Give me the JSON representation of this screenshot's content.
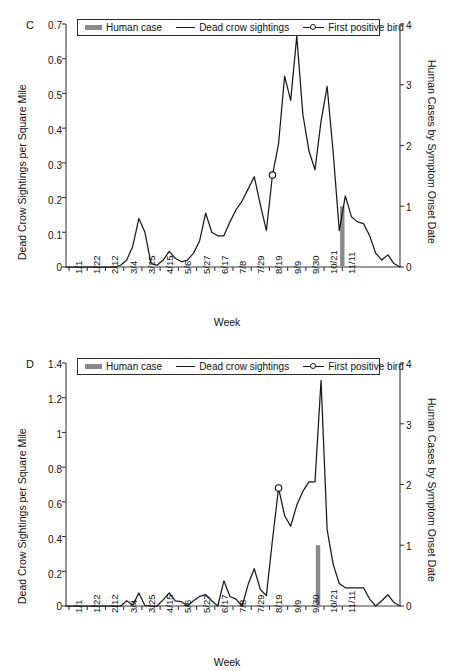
{
  "figure": {
    "xlabel": "Week",
    "ylabel_left": "Dead Crow Sightings per Square Mile",
    "ylabel_right": "Human Cases by Symptom Onset Date",
    "legend": {
      "human_case": "Human case",
      "dead_crow": "Dead crow sightings",
      "first_bird": "First positive bird"
    },
    "colors": {
      "line": "#1a1a1a",
      "human_case_bar": "#8a8a8a",
      "axis": "#3a3a3a",
      "background": "#ffffff"
    },
    "xticklabels": [
      "1/1",
      "1/22",
      "2/12",
      "3/4",
      "3/25",
      "4/15",
      "5/6",
      "5/27",
      "6/17",
      "7/8",
      "7/29",
      "8/19",
      "9/9",
      "9/30",
      "10/21",
      "11/11"
    ]
  },
  "chart_data": [
    {
      "type": "line",
      "panel": "C",
      "title": "",
      "xlabel": "Week",
      "ylabel": "Dead Crow Sightings per Square Mile",
      "ylabel_secondary": "Human Cases by Symptom Onset Date",
      "ylim": [
        0,
        0.7
      ],
      "yticks": [
        0,
        0.1,
        0.2,
        0.3,
        0.4,
        0.5,
        0.6,
        0.7
      ],
      "yticklabels": [
        "0",
        "0.1",
        "0.2",
        "0.3",
        "0.4",
        "0.5",
        "0.6",
        "0.7"
      ],
      "ylim_secondary": [
        0,
        4
      ],
      "yticks_secondary": [
        0,
        1,
        2,
        3,
        4
      ],
      "yticklabels_secondary": [
        "0",
        "1",
        "2",
        "3",
        "4"
      ],
      "xlim": [
        0,
        45
      ],
      "xticks": [
        0,
        3,
        6,
        9,
        12,
        15,
        18,
        21,
        24,
        27,
        30,
        33,
        36,
        39,
        42,
        45
      ],
      "xticklabels": [
        "1/1",
        "1/22",
        "2/12",
        "3/4",
        "3/25",
        "4/15",
        "5/6",
        "5/27",
        "6/17",
        "7/8",
        "7/29",
        "8/19",
        "9/9",
        "9/30",
        "10/21",
        "11/11"
      ],
      "grid": false,
      "legend_position": "top-center",
      "series": [
        {
          "name": "Dead crow sightings",
          "x": [
            0,
            1,
            2,
            3,
            4,
            5,
            6,
            7,
            8,
            9,
            10,
            11,
            12,
            13,
            14,
            15,
            16,
            17,
            18,
            19,
            20,
            21,
            22,
            23,
            24,
            25,
            26,
            27,
            28,
            29,
            30,
            31,
            32,
            33,
            34,
            35,
            36,
            37,
            38,
            39,
            40,
            41,
            42,
            43,
            44,
            45
          ],
          "values": [
            0,
            0,
            0,
            0,
            0,
            0,
            0,
            0,
            0,
            0.005,
            0.02,
            0.06,
            0.14,
            0.1,
            0.01,
            0.005,
            0.02,
            0.045,
            0.025,
            0.015,
            0.02,
            0.04,
            0.075,
            0.155,
            0.1,
            0.09,
            0.09,
            0.13,
            0.165,
            0.19,
            0.225,
            0.26,
            0.18,
            0.105,
            0.265,
            0.355,
            0.55,
            0.48,
            0.665,
            0.44,
            0.335,
            0.28,
            0.42,
            0.52,
            0.33,
            0.105
          ]
        }
      ],
      "markers": [
        {
          "name": "First positive bird",
          "x": 34,
          "y": 0.265,
          "label": "First positive bird"
        }
      ],
      "bars": [
        {
          "name": "Human case",
          "x": 45.5,
          "value_secondary": 1,
          "value_left_equiv": 0.175
        }
      ],
      "tail": {
        "note": "after last plotted point curve declines toward 0 by 11/11",
        "x": [
          46,
          47,
          48,
          49,
          50,
          51,
          52,
          53,
          54,
          55
        ],
        "values": [
          0.205,
          0.145,
          0.13,
          0.125,
          0.09,
          0.04,
          0.02,
          0.035,
          0.01,
          0
        ]
      }
    },
    {
      "type": "line",
      "panel": "D",
      "title": "",
      "xlabel": "Week",
      "ylabel": "Dead Crow Sightings per Square Mile",
      "ylabel_secondary": "Human Cases by Symptom Onset Date",
      "ylim": [
        0,
        1.4
      ],
      "yticks": [
        0,
        0.2,
        0.4,
        0.6,
        0.8,
        1.0,
        1.2,
        1.4
      ],
      "yticklabels": [
        "0",
        "0.2",
        "0.4",
        "0.6",
        "0.8",
        "1",
        "1.2",
        "1.4"
      ],
      "ylim_secondary": [
        0,
        4
      ],
      "yticks_secondary": [
        0,
        1,
        2,
        3,
        4
      ],
      "yticklabels_secondary": [
        "0",
        "1",
        "2",
        "3",
        "4"
      ],
      "xlim": [
        0,
        45
      ],
      "xticks": [
        0,
        3,
        6,
        9,
        12,
        15,
        18,
        21,
        24,
        27,
        30,
        33,
        36,
        39,
        42,
        45
      ],
      "xticklabels": [
        "1/1",
        "1/22",
        "2/12",
        "3/4",
        "3/25",
        "4/15",
        "5/6",
        "5/27",
        "6/17",
        "7/8",
        "7/29",
        "8/19",
        "9/9",
        "9/30",
        "10/21",
        "11/11"
      ],
      "grid": false,
      "legend_position": "top-center",
      "series": [
        {
          "name": "Dead crow sightings",
          "x": [
            0,
            1,
            2,
            3,
            4,
            5,
            6,
            7,
            8,
            9,
            10,
            11,
            12,
            13,
            14,
            15,
            16,
            17,
            18,
            19,
            20,
            21,
            22,
            23,
            24,
            25,
            26,
            27,
            28,
            29,
            30,
            31,
            32,
            33,
            34,
            35,
            36,
            37,
            38,
            39,
            40,
            41,
            42,
            43,
            44,
            45
          ],
          "values": [
            0,
            0,
            0,
            0,
            0,
            0,
            0,
            0,
            0,
            0,
            0.03,
            0.005,
            0.075,
            0.002,
            0,
            0,
            0.035,
            0.075,
            0.03,
            0.025,
            0.002,
            0.03,
            0.055,
            0.065,
            0.03,
            0,
            0.145,
            0.055,
            0.04,
            0,
            0.125,
            0.215,
            0.095,
            0.06,
            0.38,
            0.68,
            0.52,
            0.46,
            0.58,
            0.66,
            0.715,
            0.715,
            1.3,
            0.44,
            0.24,
            0.13
          ]
        }
      ],
      "markers": [
        {
          "name": "First positive bird",
          "x": 35,
          "y": 0.68,
          "label": "First positive bird"
        }
      ],
      "bars": [
        {
          "name": "Human case",
          "x": 41.5,
          "value_secondary": 1,
          "value_left_equiv": 0.345
        }
      ],
      "tail": {
        "note": "after peak the curve drops to a plateau near 0.1 then to 0",
        "x": [
          46,
          47,
          48,
          49,
          50,
          51,
          52,
          53,
          54,
          55
        ],
        "values": [
          0.105,
          0.105,
          0.105,
          0.105,
          0.04,
          0,
          0.03,
          0.065,
          0.02,
          0
        ]
      }
    }
  ]
}
